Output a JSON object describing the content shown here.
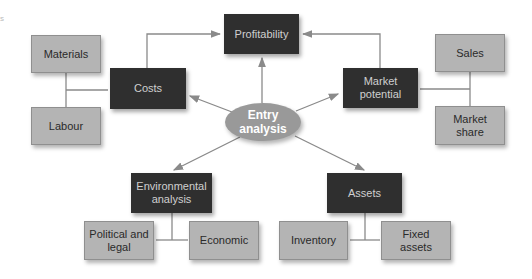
{
  "diagram": {
    "center": {
      "label": "Entry analysis",
      "line1": "Entry",
      "line2": "analysis"
    },
    "nodes": {
      "profitability": {
        "label": "Profitability"
      },
      "costs": {
        "label": "Costs"
      },
      "market_potential": {
        "line1": "Market",
        "line2": "potential"
      },
      "environmental_analysis": {
        "line1": "Environmental",
        "line2": "analysis"
      },
      "assets": {
        "label": "Assets"
      }
    },
    "subnodes": {
      "materials": {
        "label": "Materials"
      },
      "labour": {
        "label": "Labour"
      },
      "sales": {
        "label": "Sales"
      },
      "market_share": {
        "line1": "Market",
        "line2": "share"
      },
      "political_legal": {
        "line1": "Political and",
        "line2": "legal"
      },
      "economic": {
        "label": "Economic"
      },
      "inventory": {
        "label": "Inventory"
      },
      "fixed_assets": {
        "line1": "Fixed",
        "line2": "assets"
      }
    },
    "colors": {
      "dark_box": "#2f2f2f",
      "light_box": "#b4b4b4",
      "ellipse": "#999999",
      "lines": "#8a8a8a"
    }
  }
}
